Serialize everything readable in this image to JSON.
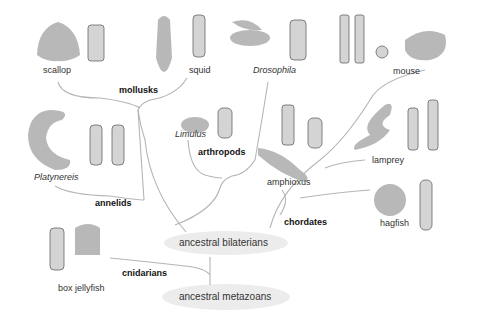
{
  "organisms": {
    "scallop": "scallop",
    "squid": "squid",
    "drosophila": "Drosophila",
    "mouse": "mouse",
    "platynereis": "Platynereis",
    "limulus": "Limulus",
    "amphioxus": "amphioxus",
    "lamprey": "lamprey",
    "hagfish": "hagfish",
    "box_jellyfish": "box jellyfish"
  },
  "groups": {
    "mollusks": "mollusks",
    "arthropods": "arthropods",
    "annelids": "annelids",
    "chordates": "chordates",
    "cnidarians": "cnidarians"
  },
  "nodes": {
    "bilaterians": "ancestral bilaterians",
    "metazoans": "ancestral metazoans"
  },
  "colors": {
    "branch": "#b5b5b5",
    "silhouette": "#b8b8b8",
    "node_fill": "#ececec",
    "cell_outline": "#666666"
  }
}
